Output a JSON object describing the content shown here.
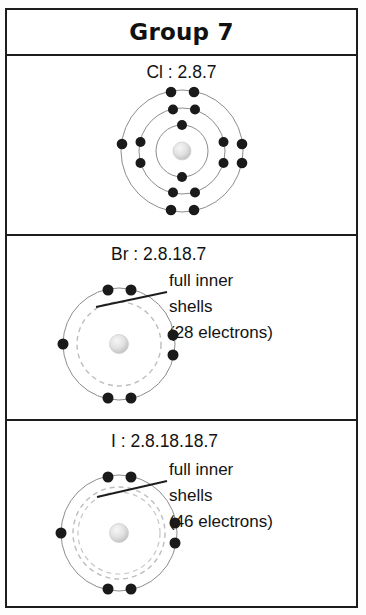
{
  "header": {
    "title": "Group 7"
  },
  "elements": [
    {
      "id": "chlorine",
      "label": "Cl : 2.8.7",
      "symbol": "Cl",
      "configuration": "2.8.7",
      "shells": [
        2,
        8,
        7
      ],
      "annotation_lines": [],
      "has_inner_shell_note": false
    },
    {
      "id": "bromine",
      "label": "Br : 2.8.18.7",
      "symbol": "Br",
      "configuration": "2.8.18.7",
      "shells": [
        2,
        8,
        18,
        7
      ],
      "annotation_lines": [
        "full inner",
        "shells",
        "(28 electrons)"
      ],
      "inner_electron_count": "28",
      "has_inner_shell_note": true
    },
    {
      "id": "iodine",
      "label": "I : 2.8.18.18.7",
      "symbol": "I",
      "configuration": "2.8.18.18.7",
      "shells": [
        2,
        8,
        18,
        18,
        7
      ],
      "annotation_lines": [
        "full inner",
        "shells",
        "(46 electrons)"
      ],
      "inner_electron_count": "46",
      "has_inner_shell_note": true
    }
  ],
  "colors": {
    "border": "#1d1d1d",
    "electron": "#1a1a1a",
    "shell_line": "#8d8d8d",
    "dashed_shell": "#b9b9b9",
    "nucleus_light": "#efefef",
    "nucleus_dark": "#bdbdbd",
    "text": "#131313",
    "background": "#ffffff"
  }
}
